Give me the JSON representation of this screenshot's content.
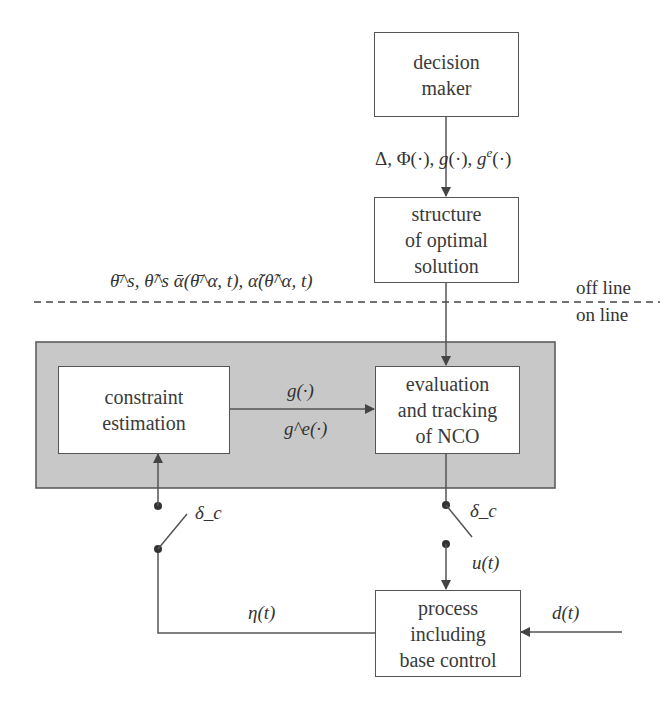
{
  "diagram": {
    "boxes": {
      "decision_maker": [
        "decision",
        "maker"
      ],
      "structure": [
        "structure",
        "of optimal",
        "solution"
      ],
      "constraint_estimation": [
        "constraint",
        "estimation"
      ],
      "evaluation": [
        "evaluation",
        "and tracking",
        "of NCO"
      ],
      "process": [
        "process",
        "including",
        "base control"
      ]
    },
    "labels": {
      "decision_outputs": "Δ, Φ(·), g(·), g^e(·)",
      "decision_outputs_parts": {
        "a": "Δ, Φ(·), ",
        "g": "g",
        "b": "(·), ",
        "g2": "g",
        "e": "e",
        "c": "(·)"
      },
      "parameters": "θ̄^s, θ̃^s ᾱ(θ̄^α, t), α̃(θ̃^α, t)",
      "off_line": "off line",
      "on_line": "on line",
      "g_label": "g(·)",
      "ge_label": "g^e(·)",
      "delta_c_left": "δ_c",
      "delta_c_right": "δ_c",
      "u_t": "u(t)",
      "eta_t": "η(t)",
      "d_t": "d(t)"
    },
    "colors": {
      "online_region": "#c8c8c8",
      "line": "#555555",
      "box_fill": "#ffffff"
    }
  }
}
